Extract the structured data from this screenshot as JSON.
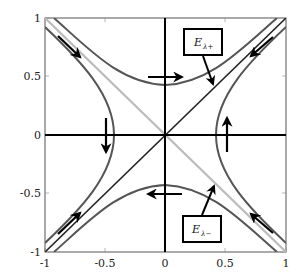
{
  "figure": {
    "type": "phase-portrait",
    "axes": {
      "xlim": [
        -1,
        1
      ],
      "ylim": [
        -1,
        1
      ],
      "x_ticks": [
        "-1",
        "-0.5",
        "0",
        "0.5",
        "1"
      ],
      "y_ticks": [
        "1",
        "0.5",
        "0",
        "-0.5",
        "-1"
      ]
    },
    "eigenspaces": [
      {
        "name": "E_lambda_plus",
        "label": "E",
        "subscript": "λ+",
        "line": "y = x",
        "color": "#222222"
      },
      {
        "name": "E_lambda_minus",
        "label": "E",
        "subscript": "λ−",
        "line": "y = -x",
        "color": "#bbbbbb"
      }
    ],
    "trajectories": {
      "family": "x^2 - y^2 = ±0.18",
      "color": "#555555"
    },
    "colors": {
      "axis": "#000000",
      "frame": "#555555",
      "trajectory": "#555555",
      "stable_line": "#bbbbbb",
      "unstable_line": "#222222",
      "arrow": "#000000"
    }
  }
}
